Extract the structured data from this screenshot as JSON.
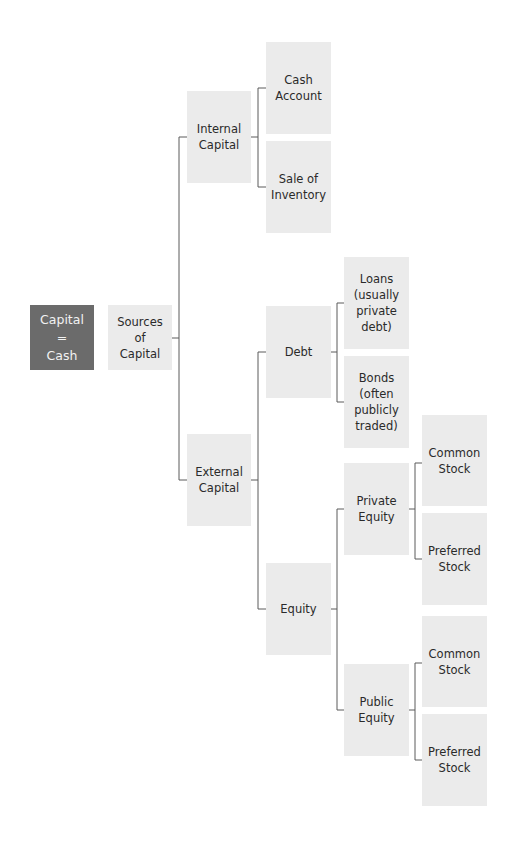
{
  "diagram": {
    "type": "tree",
    "colors": {
      "root_fill": "#6b6b6b",
      "node_fill": "#ebebeb",
      "line": "#5a5a5a",
      "text": "#2a2a2a"
    },
    "nodes": {
      "root": "Capital\n=\nCash",
      "sources": "Sources of\nCapital",
      "internal": "Internal\nCapital",
      "cash_account": "Cash\nAccount",
      "sale_inventory": "Sale of\nInventory",
      "external": "External\nCapital",
      "debt": "Debt",
      "loans": "Loans\n(usually\nprivate\ndebt)",
      "bonds": "Bonds\n(often\npublicly\ntraded)",
      "equity": "Equity",
      "private_equity": "Private\nEquity",
      "private_common": "Common\nStock",
      "private_preferred": "Preferred\nStock",
      "public_equity": "Public\nEquity",
      "public_common": "Common\nStock",
      "public_preferred": "Preferred\nStock"
    },
    "edges": [
      [
        "Sources of Capital",
        "Internal Capital"
      ],
      [
        "Sources of Capital",
        "External Capital"
      ],
      [
        "Internal Capital",
        "Cash Account"
      ],
      [
        "Internal Capital",
        "Sale of Inventory"
      ],
      [
        "External Capital",
        "Debt"
      ],
      [
        "External Capital",
        "Equity"
      ],
      [
        "Debt",
        "Loans (usually private debt)"
      ],
      [
        "Debt",
        "Bonds (often publicly traded)"
      ],
      [
        "Equity",
        "Private Equity"
      ],
      [
        "Equity",
        "Public Equity"
      ],
      [
        "Private Equity",
        "Common Stock"
      ],
      [
        "Private Equity",
        "Preferred Stock"
      ],
      [
        "Public Equity",
        "Common Stock"
      ],
      [
        "Public Equity",
        "Preferred Stock"
      ]
    ]
  }
}
